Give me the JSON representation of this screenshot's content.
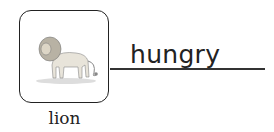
{
  "card": {
    "image_label": "lion-illustration",
    "caption": "lion"
  },
  "answer": {
    "word": "hungry"
  }
}
